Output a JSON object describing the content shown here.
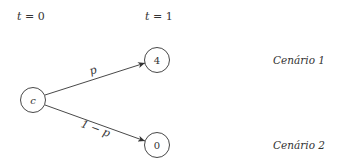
{
  "diagram": {
    "type": "probability-tree",
    "time_labels": [
      {
        "var": "t",
        "eq": " = ",
        "val": "0"
      },
      {
        "var": "t",
        "eq": " = ",
        "val": "1"
      }
    ],
    "nodes": {
      "root": {
        "label": "c"
      },
      "up": {
        "label": "4"
      },
      "down": {
        "label": "0"
      }
    },
    "edges": {
      "up": {
        "label": "p"
      },
      "down": {
        "label": "1 − p"
      }
    },
    "scenarios": [
      {
        "label": "Cenário 1"
      },
      {
        "label": "Cenário 2"
      }
    ],
    "colors": {
      "stroke": "#333333",
      "text": "#333333",
      "background": "#ffffff"
    }
  }
}
